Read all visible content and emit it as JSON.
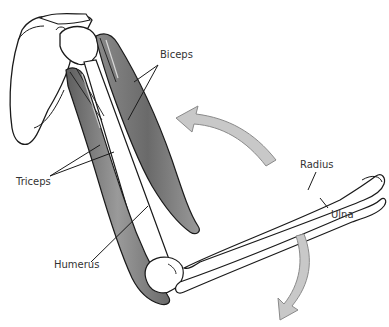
{
  "diagram": {
    "labels": {
      "biceps": "Biceps",
      "triceps": "Triceps",
      "humerus": "Humerus",
      "radius": "Radius",
      "ulna": "Ulna"
    },
    "arrows": [
      {
        "name": "upper-arrow",
        "direction": "counter-clockwise toward upper arm"
      },
      {
        "name": "lower-arrow",
        "direction": "downward curve"
      }
    ],
    "colors": {
      "outline": "#1a1a1a",
      "muscle_dark": "#6e6e6e",
      "muscle_light": "#b5b5b5",
      "arrow_fill": "#c8c8c8",
      "arrow_stroke": "#8a8a8a",
      "bone": "#ffffff",
      "label": "#333333"
    }
  }
}
